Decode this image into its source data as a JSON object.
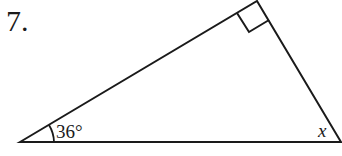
{
  "problem": {
    "number": "7."
  },
  "triangle": {
    "angle_label": "36°",
    "unknown_label": "x",
    "right_angle": true,
    "stroke_color": "#1a1a1a"
  }
}
